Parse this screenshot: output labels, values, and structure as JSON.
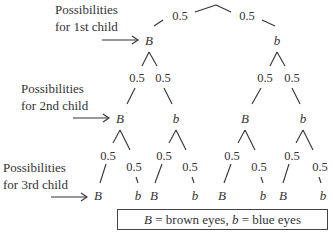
{
  "row_labels": [
    {
      "line1": "Possibilities",
      "line2": "for 1st child"
    },
    {
      "line1": "Possibilities",
      "line2": "for 2nd child"
    },
    {
      "line1": "Possibilities",
      "line2": "for 3rd child"
    }
  ],
  "tree": {
    "root_branches": [
      "0.5",
      "0.5"
    ],
    "level1": [
      "B",
      "b"
    ],
    "level1_branches": [
      "0.5",
      "0.5",
      "0.5",
      "0.5"
    ],
    "level2": [
      "B",
      "b",
      "B",
      "b"
    ],
    "level2_branches": [
      "0.5",
      "0.5",
      "0.5",
      "0.5",
      "0.5",
      "0.5",
      "0.5",
      "0.5"
    ],
    "level3": [
      "B",
      "b",
      "B",
      "b",
      "B",
      "b",
      "B",
      "b"
    ]
  },
  "legend": {
    "sym_B": "B",
    "text_B": " = brown eyes, ",
    "sym_b": "b",
    "text_b": " = blue eyes"
  }
}
